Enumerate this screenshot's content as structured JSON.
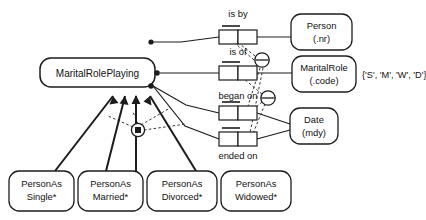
{
  "diagram": {
    "type": "orm-fact-diagram",
    "objectified_fact_type": {
      "name": "MaritalRolePlaying"
    },
    "entities": [
      {
        "id": "person",
        "name": "Person",
        "reference": "(.nr)"
      },
      {
        "id": "maritalrole",
        "name": "MaritalRole",
        "reference": "(.code)"
      },
      {
        "id": "date",
        "name": "Date",
        "reference": "(mdy)"
      }
    ],
    "value_constraint": {
      "applies_to": "MaritalRole",
      "text": "{'S', 'M', 'W', 'D'}"
    },
    "predicates": [
      {
        "id": "is-by",
        "label": "is by",
        "roles": 2,
        "uniqueness": "first-role"
      },
      {
        "id": "is-of",
        "label": "is of",
        "roles": 2,
        "uniqueness": "first-role"
      },
      {
        "id": "began-on",
        "label": "began on",
        "roles": 2,
        "uniqueness": "first-role"
      },
      {
        "id": "ended-on",
        "label": "ended on",
        "roles": 2,
        "uniqueness": "first-role"
      }
    ],
    "subtypes": [
      {
        "id": "single",
        "line1": "PersonAs",
        "line2": "Single*"
      },
      {
        "id": "married",
        "line1": "PersonAs",
        "line2": "Married*"
      },
      {
        "id": "divorced",
        "line1": "PersonAs",
        "line2": "Divorced*"
      },
      {
        "id": "widowed",
        "line1": "PersonAs",
        "line2": "Widowed*"
      }
    ],
    "constraints": [
      {
        "id": "exclusion-upper",
        "symbol": "circle-with-bar",
        "meaning": "exclusion"
      },
      {
        "id": "exclusion-lower",
        "symbol": "circle-with-bar",
        "meaning": "exclusion"
      },
      {
        "id": "partition",
        "symbol": "circle-with-dot",
        "meaning": "exclusive-or-partition"
      }
    ],
    "colors": {
      "stroke": "#1c1c1c",
      "fill": "#ffffff",
      "dashed": "#3a3a3a"
    }
  }
}
